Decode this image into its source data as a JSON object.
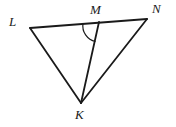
{
  "figure": {
    "type": "geometry-diagram",
    "background_color": "#ffffff",
    "stroke_color": "#1a1a1a",
    "stroke_width": 1.8,
    "arc_stroke_width": 1.2,
    "vertices": [
      {
        "id": "L",
        "label": "L",
        "x": 30,
        "y": 28
      },
      {
        "id": "M",
        "label": "M",
        "x": 99,
        "y": 22
      },
      {
        "id": "N",
        "label": "N",
        "x": 147,
        "y": 19
      },
      {
        "id": "K",
        "label": "K",
        "x": 81,
        "y": 103
      }
    ],
    "segments": [
      {
        "id": "LN",
        "from": "L",
        "to": "N",
        "x1": 30,
        "y1": 28,
        "x2": 147,
        "y2": 19
      },
      {
        "id": "LK",
        "from": "L",
        "to": "K",
        "x1": 30,
        "y1": 28,
        "x2": 81,
        "y2": 103
      },
      {
        "id": "NK",
        "from": "N",
        "to": "K",
        "x1": 147,
        "y1": 19,
        "x2": 81,
        "y2": 103
      },
      {
        "id": "MK",
        "from": "M",
        "to": "K",
        "x1": 99,
        "y1": 22,
        "x2": 81,
        "y2": 103
      }
    ],
    "angle_marks": [
      {
        "id": "angle-LMK",
        "at_vertex": "M",
        "between": [
          "ML",
          "MK"
        ],
        "arc_path": "M 83.0 23.3 A 16 16 0 0 0 95.5 41.5",
        "radius": 16
      }
    ]
  }
}
